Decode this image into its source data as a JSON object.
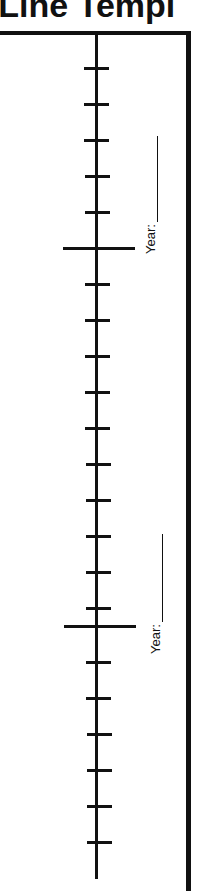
{
  "header": {
    "title": "e Line Templ"
  },
  "timeline": {
    "year_label_1": "Year:",
    "year_label_2": "Year:",
    "tick_spacing_px": 36,
    "major_ticks": [
      247,
      625
    ],
    "minor_ticks": [
      67,
      103,
      139,
      175,
      211,
      283,
      319,
      355,
      391,
      427,
      463,
      499,
      535,
      571,
      607,
      661,
      697,
      733,
      769,
      805,
      841
    ]
  }
}
